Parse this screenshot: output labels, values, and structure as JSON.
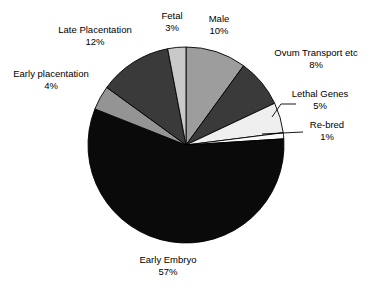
{
  "chart_data": {
    "type": "pie",
    "title": "",
    "subtitle": "",
    "xlabel": "",
    "ylabel": "",
    "legend_position": "none",
    "grid": false,
    "start_angle_deg": 0,
    "direction": "clockwise",
    "total_percent": 100,
    "categories": [
      "Male",
      "Ovum Transport etc",
      "Lethal Genes",
      "Re-bred",
      "Early Embryo",
      "Early placentation",
      "Late Placentation",
      "Fetal"
    ],
    "values": [
      10,
      8,
      5,
      1,
      57,
      4,
      12,
      3
    ],
    "value_suffix": "%",
    "slices": [
      {
        "label": "Male",
        "value": 10,
        "percent_text": "10%",
        "color": "#9d9d9d",
        "label_x": 219,
        "label_y": 13,
        "leader": false
      },
      {
        "label": "Ovum Transport etc",
        "value": 8,
        "percent_text": "8%",
        "color": "#3a3a3a",
        "label_x": 316,
        "label_y": 47,
        "leader": false
      },
      {
        "label": "Lethal Genes",
        "value": 5,
        "percent_text": "5%",
        "color": "#efefef",
        "label_x": 320,
        "label_y": 88,
        "leader": true
      },
      {
        "label": "Re-bred",
        "value": 1,
        "percent_text": "1%",
        "color": "#fbfbfb",
        "label_x": 327,
        "label_y": 119,
        "leader": true
      },
      {
        "label": "Early Embryo",
        "value": 57,
        "percent_text": "57%",
        "color": "#0a0a0a",
        "label_x": 168,
        "label_y": 254,
        "leader": false
      },
      {
        "label": "Early placentation",
        "value": 4,
        "percent_text": "4%",
        "color": "#949494",
        "label_x": 51,
        "label_y": 68,
        "leader": false
      },
      {
        "label": "Late Placentation",
        "value": 12,
        "percent_text": "12%",
        "color": "#3a3a3a",
        "label_x": 95,
        "label_y": 24,
        "leader": false
      },
      {
        "label": "Fetal",
        "value": 3,
        "percent_text": "3%",
        "color": "#c9c9c9",
        "label_x": 172,
        "label_y": 10,
        "leader": false
      }
    ],
    "geometry": {
      "center_x": 186,
      "center_y": 145,
      "radius": 98,
      "outline_color": "#000000"
    }
  }
}
